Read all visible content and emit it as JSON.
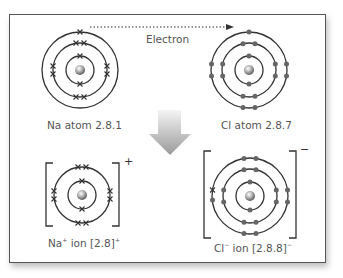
{
  "arrow_label": "Electron",
  "atoms": [
    {
      "id": "na-atom",
      "label": "Na atom 2.8.1",
      "shells": [
        2,
        8,
        1
      ],
      "marker": "cross"
    },
    {
      "id": "cl-atom",
      "label": "Cl atom 2.8.7",
      "shells": [
        2,
        8,
        7
      ],
      "marker": "dot"
    }
  ],
  "ions": [
    {
      "id": "na-ion",
      "label_base": "Na",
      "label_sup": "+",
      "label_rest": " ion [2.8]",
      "label_end_sup": "+",
      "charge": "+",
      "shells": [
        2,
        8
      ]
    },
    {
      "id": "cl-ion",
      "label_base": "Cl",
      "label_sup": "−",
      "label_rest": " ion [2.8.8]",
      "label_end_sup": "−",
      "charge": "−",
      "shells": [
        2,
        8,
        8
      ]
    }
  ],
  "colors": {
    "line": "#333333",
    "dot": "#666666",
    "label": "#555555",
    "arrow_top": "#f2f2f2",
    "arrow_bottom": "#9a9a9a"
  }
}
